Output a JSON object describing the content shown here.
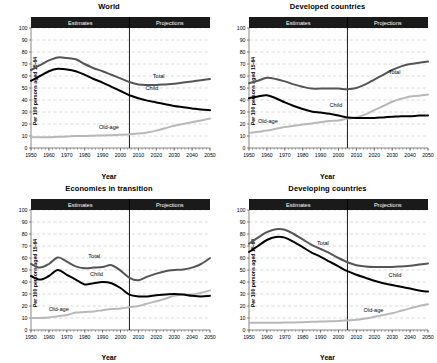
{
  "figure": {
    "axis_titles": {
      "x": "Year",
      "y": "Per 100 persons aged 15-64"
    },
    "band_labels": {
      "estimates": "Estimates",
      "projections": "Projections"
    },
    "series_names": {
      "total": "Total",
      "child": "Child",
      "oldage": "Old-age"
    },
    "colors": {
      "total": "#555555",
      "child": "#000000",
      "oldage": "#b8b8b8",
      "band": "#1a1a1a",
      "grid": "#bdbdbd",
      "axis": "#555555",
      "divider": "#000000",
      "background": "#ffffff"
    }
  },
  "chart_data": [
    {
      "type": "line",
      "title": "World",
      "xlabel": "Year",
      "ylabel": "Per 100 persons aged 15-64",
      "xlim": [
        1950,
        2050
      ],
      "ylim": [
        0,
        100
      ],
      "xticks": [
        1950,
        1960,
        1970,
        1980,
        1990,
        2000,
        2010,
        2020,
        2030,
        2040,
        2050
      ],
      "yticks": [
        0,
        10,
        20,
        30,
        40,
        50,
        60,
        70,
        80,
        90,
        100
      ],
      "grid": true,
      "legend": "inline-annotations",
      "estimates_range": [
        1950,
        2005
      ],
      "projections_range": [
        2005,
        2050
      ],
      "divider_x": 2005,
      "x": [
        1950,
        1955,
        1960,
        1965,
        1970,
        1975,
        1980,
        1985,
        1990,
        1995,
        2000,
        2005,
        2010,
        2015,
        2020,
        2025,
        2030,
        2035,
        2040,
        2045,
        2050
      ],
      "series": [
        {
          "name": "Total",
          "values": [
            65,
            69,
            73,
            75.5,
            75,
            74,
            70,
            66.5,
            64,
            61,
            58,
            55,
            53,
            52.5,
            52.5,
            53,
            53.5,
            54.5,
            55.5,
            56.5,
            57.5
          ]
        },
        {
          "name": "Child",
          "values": [
            56,
            60,
            64,
            66,
            65.5,
            64,
            61,
            57.5,
            54.5,
            51,
            47.5,
            44,
            41.5,
            39.5,
            38,
            36.5,
            35,
            34,
            33,
            32,
            31.5
          ]
        },
        {
          "name": "Old-age",
          "values": [
            9,
            9,
            9,
            9.3,
            9.6,
            10,
            10,
            10.3,
            10.5,
            10.7,
            11,
            11.5,
            12,
            13,
            14.5,
            16.5,
            18.5,
            20,
            21.5,
            23,
            24.5
          ]
        }
      ]
    },
    {
      "type": "line",
      "title": "Developed countries",
      "xlabel": "Year",
      "ylabel": "Per 100 persons aged 15-64",
      "xlim": [
        1950,
        2050
      ],
      "ylim": [
        0,
        100
      ],
      "xticks": [
        1950,
        1960,
        1970,
        1980,
        1990,
        2000,
        2010,
        2020,
        2030,
        2040,
        2050
      ],
      "yticks": [
        0,
        10,
        20,
        30,
        40,
        50,
        60,
        70,
        80,
        90,
        100
      ],
      "grid": true,
      "legend": "inline-annotations",
      "estimates_range": [
        1950,
        2005
      ],
      "projections_range": [
        2005,
        2050
      ],
      "divider_x": 2005,
      "x": [
        1950,
        1955,
        1960,
        1965,
        1970,
        1975,
        1980,
        1985,
        1990,
        1995,
        2000,
        2005,
        2010,
        2015,
        2020,
        2025,
        2030,
        2035,
        2040,
        2045,
        2050
      ],
      "series": [
        {
          "name": "Total",
          "values": [
            54,
            56,
            58.5,
            57.5,
            55.5,
            53,
            51,
            49.5,
            49.5,
            49.5,
            49.5,
            49,
            50,
            53,
            57,
            61,
            65,
            68,
            70,
            71,
            72
          ]
        },
        {
          "name": "Child",
          "values": [
            41.5,
            43,
            44,
            41.5,
            38,
            35,
            32.5,
            30.5,
            29.5,
            28.5,
            27,
            25.5,
            25,
            25,
            25,
            25.5,
            26,
            26.5,
            26.5,
            27,
            27
          ]
        },
        {
          "name": "Old-age",
          "values": [
            12.5,
            13.5,
            14.5,
            16,
            17.5,
            18.5,
            19.5,
            20.5,
            21.5,
            22.5,
            23,
            24.5,
            25.5,
            28,
            31.5,
            35,
            38.5,
            41,
            43,
            43.5,
            44.5
          ]
        }
      ]
    },
    {
      "type": "line",
      "title": "Economies in transition",
      "xlabel": "Year",
      "ylabel": "Per 100 persons aged 15-64",
      "xlim": [
        1950,
        2050
      ],
      "ylim": [
        0,
        100
      ],
      "xticks": [
        1950,
        1960,
        1970,
        1980,
        1990,
        2000,
        2010,
        2020,
        2030,
        2040,
        2050
      ],
      "yticks": [
        0,
        10,
        20,
        30,
        40,
        50,
        60,
        70,
        80,
        90,
        100
      ],
      "grid": true,
      "legend": "inline-annotations",
      "estimates_range": [
        1950,
        2005
      ],
      "projections_range": [
        2005,
        2050
      ],
      "divider_x": 2005,
      "x": [
        1950,
        1955,
        1960,
        1965,
        1970,
        1975,
        1980,
        1985,
        1990,
        1995,
        2000,
        2005,
        2010,
        2015,
        2020,
        2025,
        2030,
        2035,
        2040,
        2045,
        2050
      ],
      "series": [
        {
          "name": "Total",
          "values": [
            55,
            52,
            55,
            60.5,
            57,
            53,
            51.5,
            52,
            52.5,
            54,
            49.5,
            43.5,
            41.5,
            44.5,
            47,
            49,
            50,
            50.5,
            52,
            55,
            60
          ]
        },
        {
          "name": "Child",
          "values": [
            45,
            42,
            45,
            50,
            46,
            42,
            38,
            39,
            40,
            39,
            35,
            29.5,
            28,
            28,
            29,
            29.5,
            30,
            29.5,
            28.5,
            28,
            28.5
          ]
        },
        {
          "name": "Old-age",
          "values": [
            10,
            10,
            10.5,
            11.5,
            12.5,
            14.5,
            15,
            15.5,
            16.5,
            17.5,
            18,
            19,
            20,
            22,
            24,
            26,
            28.5,
            29.5,
            29.5,
            31,
            33
          ]
        }
      ]
    },
    {
      "type": "line",
      "title": "Developing countries",
      "xlabel": "Year",
      "ylabel": "Per 100 persons aged 15-64",
      "xlim": [
        1950,
        2050
      ],
      "ylim": [
        0,
        100
      ],
      "xticks": [
        1950,
        1960,
        1970,
        1980,
        1990,
        2000,
        2010,
        2020,
        2030,
        2040,
        2050
      ],
      "yticks": [
        0,
        10,
        20,
        30,
        40,
        50,
        60,
        70,
        80,
        90,
        100
      ],
      "grid": true,
      "legend": "inline-annotations",
      "estimates_range": [
        1950,
        2005
      ],
      "projections_range": [
        2005,
        2050
      ],
      "divider_x": 2005,
      "x": [
        1950,
        1955,
        1960,
        1965,
        1970,
        1975,
        1980,
        1985,
        1990,
        1995,
        2000,
        2005,
        2010,
        2015,
        2020,
        2025,
        2030,
        2035,
        2040,
        2045,
        2050
      ],
      "series": [
        {
          "name": "Total",
          "values": [
            72,
            77,
            81.5,
            84,
            83.5,
            80,
            75.5,
            71,
            67.5,
            64,
            60,
            56.5,
            54,
            53,
            52.5,
            52.5,
            52.5,
            53,
            53.5,
            54.5,
            55.5
          ]
        },
        {
          "name": "Child",
          "values": [
            65,
            70,
            75,
            77.5,
            77,
            73.5,
            69,
            64.5,
            61,
            57,
            53,
            49,
            46,
            43.5,
            41,
            39,
            37.5,
            36,
            34.5,
            33,
            32
          ]
        },
        {
          "name": "Old-age",
          "values": [
            6,
            6,
            6,
            6,
            6.2,
            6.3,
            6.5,
            6.8,
            7,
            7.2,
            7.5,
            8,
            8.5,
            9.5,
            11,
            12.5,
            14,
            16,
            18,
            20,
            21.5
          ]
        }
      ]
    }
  ]
}
